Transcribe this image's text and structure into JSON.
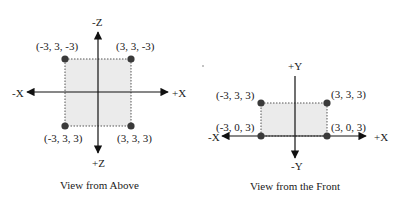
{
  "top_view": {
    "caption": "View from Above",
    "axes": {
      "neg_z": "-Z",
      "pos_z": "+Z",
      "neg_x": "-X",
      "pos_x": "+X"
    },
    "points": [
      {
        "label": "(-3, 3, -3)"
      },
      {
        "label": "(3, 3, -3)"
      },
      {
        "label": "(-3, 3, 3)"
      },
      {
        "label": "(3, 3, 3)"
      }
    ]
  },
  "front_view": {
    "caption": "View from the Front",
    "axes": {
      "pos_y": "+Y",
      "neg_y": "-Y",
      "neg_x": "-X",
      "pos_x": "+X"
    },
    "points": [
      {
        "label": "(-3, 3, 3)"
      },
      {
        "label": "(3, 3, 3)"
      },
      {
        "label": "(-3, 0, 3)"
      },
      {
        "label": "(3, 0, 3)"
      }
    ]
  },
  "colors": {
    "fill": "#ebebeb",
    "dot": "#3a3a3a",
    "line": "#111111"
  }
}
